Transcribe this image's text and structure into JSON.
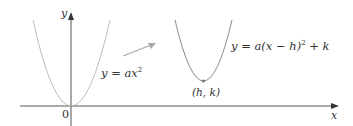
{
  "diagram": {
    "axes": {
      "x_label": "x",
      "y_label": "y",
      "origin_label": "0"
    },
    "curves": [
      {
        "name": "base-parabola",
        "equation": "y = ax²",
        "eq_prefix": "y = ax",
        "eq_sup": "2",
        "color": "#b8b8b8"
      },
      {
        "name": "shifted-parabola",
        "equation": "y = a(x − h)² + k",
        "eq_prefix": "y = a(x − h)",
        "eq_sup": "2",
        "eq_suffix": " + k",
        "color": "#8a8a8a"
      }
    ],
    "vertex_label": "(h, k)",
    "arrow_color": "#a0a0a0"
  }
}
